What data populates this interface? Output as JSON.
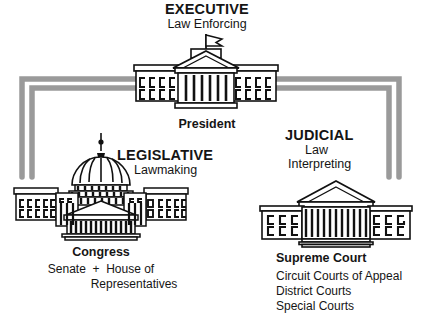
{
  "diagram": {
    "title_text": "Three Branches of Government",
    "ink_color": "#111111",
    "connector_color": "#9a9a9a"
  },
  "branches": {
    "executive": {
      "title": "EXECUTIVE",
      "subtitle": "Law Enforcing",
      "office": "President",
      "building_icon": "white-house-icon"
    },
    "legislative": {
      "title": "LEGISLATIVE",
      "subtitle": "Lawmaking",
      "office": "Congress",
      "office_detail_line1": "Senate  +  House of",
      "office_detail_line2": "Representatives",
      "building_icon": "capitol-icon"
    },
    "judicial": {
      "title": "JUDICIAL",
      "subtitle_line1": "Law",
      "subtitle_line2": "Interpreting",
      "office": "Supreme Court",
      "office_detail_line1": "Circuit Courts of Appeal",
      "office_detail_line2": "District Courts",
      "office_detail_line3": "Special Courts",
      "building_icon": "supreme-court-icon"
    }
  },
  "connectors": {
    "left_bracket_name": "executive-to-legislative-connector",
    "right_bracket_name": "executive-to-judicial-connector"
  }
}
